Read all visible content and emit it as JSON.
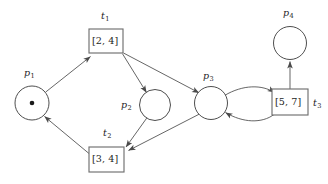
{
  "diagram": {
    "type": "petri-net",
    "places": [
      {
        "id": "p1",
        "name": "p",
        "index": "1",
        "label": "p1",
        "cx": 32,
        "cy": 103,
        "r": 17,
        "tokens": 1
      },
      {
        "id": "p2",
        "name": "p",
        "index": "2",
        "label": "p2",
        "cx": 155,
        "cy": 105,
        "r": 15.5,
        "tokens": 0
      },
      {
        "id": "p3",
        "name": "p",
        "index": "3",
        "label": "p3",
        "cx": 211,
        "cy": 103,
        "r": 16.5,
        "tokens": 0
      },
      {
        "id": "p4",
        "name": "p",
        "index": "4",
        "label": "p4",
        "cx": 290,
        "cy": 43,
        "r": 16.5,
        "tokens": 0
      }
    ],
    "transitions": [
      {
        "id": "t1",
        "name": "t",
        "index": "1",
        "label": "t1",
        "interval": "[2, 4]",
        "x": 89,
        "y": 29,
        "w": 34,
        "h": 24
      },
      {
        "id": "t2",
        "name": "t",
        "index": "2",
        "label": "t2",
        "interval": "[3, 4]",
        "x": 89,
        "y": 147,
        "w": 35,
        "h": 25
      },
      {
        "id": "t3",
        "name": "t",
        "index": "3",
        "label": "t3",
        "interval": "[5, 7]",
        "x": 272,
        "y": 89,
        "w": 36,
        "h": 26
      }
    ],
    "arcs": [
      {
        "from": "p1",
        "to": "t1",
        "shape": "straight"
      },
      {
        "from": "t1",
        "to": "p2",
        "shape": "straight"
      },
      {
        "from": "t1",
        "to": "p3",
        "shape": "straight"
      },
      {
        "from": "p2",
        "to": "t2",
        "shape": "straight"
      },
      {
        "from": "p3",
        "to": "t2",
        "shape": "straight"
      },
      {
        "from": "t2",
        "to": "p1",
        "shape": "straight"
      },
      {
        "from": "p3",
        "to": "t3",
        "shape": "curved-upper"
      },
      {
        "from": "t3",
        "to": "p3",
        "shape": "curved-lower"
      },
      {
        "from": "t3",
        "to": "p4",
        "shape": "straight"
      }
    ],
    "labels": {
      "p1": {
        "text": "p",
        "sub": "1",
        "x": 24,
        "y": 68
      },
      "p2": {
        "text": "p",
        "sub": "2",
        "x": 121,
        "y": 100
      },
      "p3": {
        "text": "p",
        "sub": "3",
        "x": 203,
        "y": 71
      },
      "p4": {
        "text": "p",
        "sub": "4",
        "x": 283,
        "y": 8
      },
      "t1": {
        "text": "t",
        "sub": "1",
        "x": 101,
        "y": 11
      },
      "t2": {
        "text": "t",
        "sub": "2",
        "x": 103,
        "y": 128
      },
      "t3": {
        "text": "t",
        "sub": "3",
        "x": 313,
        "y": 98
      }
    },
    "colors": {
      "stroke": "#4a4a4a",
      "place_stroke": "#3a3a3a",
      "transition_stroke": "#707070",
      "token": "#1a1a1a",
      "text": "#1d1d1d",
      "background": "#ffffff"
    }
  }
}
